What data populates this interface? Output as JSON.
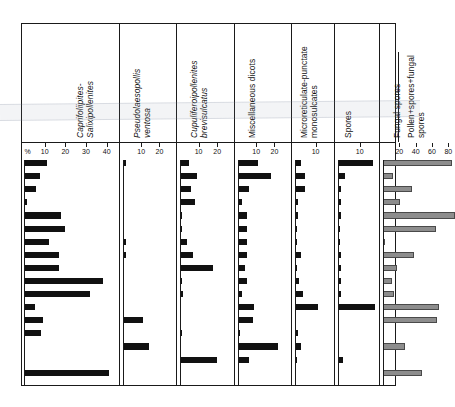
{
  "figure": {
    "type": "pollen-percentage-diagram",
    "background_color": "#ffffff",
    "bar_color": "#111111",
    "bar_color_secondary": "#8d8d8d",
    "frame_color": "#1a1a1a",
    "percent_symbol": "%",
    "n_samples": 17
  },
  "chart_data": {
    "type": "bar",
    "title": "",
    "subtitle": "",
    "xlabel": "",
    "ylabel": "",
    "orientation": "horizontal",
    "grid": false,
    "legend_position": "none",
    "categories": [
      "1",
      "2",
      "3",
      "4",
      "5",
      "6",
      "7",
      "8",
      "9",
      "10",
      "11",
      "12",
      "13",
      "14",
      "15",
      "16",
      "17"
    ],
    "panels": [
      {
        "name": "Caprifoliipites-Salixipollenites",
        "label_lines": [
          "Caprifoliipites-",
          "Salixipollenites"
        ],
        "italic": true,
        "axis_prefix": "%",
        "ticks": [
          10,
          20,
          30,
          40
        ],
        "tick_labels": [
          "10",
          "20",
          "30",
          "40"
        ],
        "xlim": [
          0,
          45
        ],
        "values": [
          11,
          7.5,
          6,
          1.5,
          18,
          20,
          12,
          17,
          17,
          38,
          32,
          5.5,
          9,
          8,
          0,
          0,
          41
        ],
        "bar_style": "dark"
      },
      {
        "name": "Pseudolaesopollis ventosa",
        "label_lines": [
          "Pseudolaesopollis",
          "ventosa"
        ],
        "italic": true,
        "axis_prefix": "",
        "ticks": [
          10,
          20
        ],
        "tick_labels": [
          "10",
          "20"
        ],
        "xlim": [
          0,
          28
        ],
        "values": [
          1.5,
          0,
          0,
          0,
          0,
          0,
          1.5,
          1.5,
          0,
          0,
          0,
          0,
          11,
          0,
          14,
          0,
          0
        ],
        "bar_style": "dark"
      },
      {
        "name": "Cupuliferoipollenites brevisulcatus",
        "label_lines": [
          "Cupuliferoipollenites",
          "brevisulcatus"
        ],
        "italic": true,
        "axis_prefix": "",
        "ticks": [
          10,
          20
        ],
        "tick_labels": [
          "10",
          "20"
        ],
        "xlim": [
          0,
          28
        ],
        "values": [
          5,
          9,
          6,
          8,
          1,
          1,
          4,
          7,
          18,
          1,
          1.5,
          0,
          0,
          1,
          0,
          20,
          0
        ],
        "bar_style": "dark"
      },
      {
        "name": "Miscellaneous dicots",
        "label_lines": [
          "Miscellaneous dicots"
        ],
        "italic": false,
        "axis_prefix": "",
        "ticks": [
          10,
          20
        ],
        "tick_labels": [
          "10",
          "20"
        ],
        "xlim": [
          0,
          28
        ],
        "values": [
          11,
          18,
          6,
          2,
          5,
          5,
          5,
          5,
          4,
          5,
          2,
          9,
          8,
          1,
          22,
          6,
          0
        ],
        "bar_style": "dark"
      },
      {
        "name": "Microreticulate-punctate monosulcates",
        "label_lines": [
          "Microreticulate-punctate",
          "monosulcates"
        ],
        "italic": false,
        "axis_prefix": "",
        "ticks": [
          10
        ],
        "tick_labels": [
          "10"
        ],
        "xlim": [
          0,
          18
        ],
        "values": [
          3,
          5,
          5,
          1.5,
          1.5,
          0.8,
          1.2,
          3,
          0.8,
          2,
          4,
          11,
          0,
          1.5,
          3,
          1,
          0
        ],
        "bar_style": "dark"
      },
      {
        "name": "Spores",
        "label_lines": [
          "Spores"
        ],
        "italic": false,
        "axis_prefix": "",
        "ticks": [
          10
        ],
        "tick_labels": [
          "10"
        ],
        "xlim": [
          0,
          18
        ],
        "values": [
          16,
          3,
          1.5,
          1.5,
          1.5,
          0.8,
          0.8,
          1.2,
          1.2,
          1.5,
          1.5,
          17,
          0,
          0,
          0,
          2.5,
          0
        ],
        "bar_style": "dark"
      },
      {
        "name": "Pollen+spores+fungal spores",
        "label_lines": [
          "Fungal spores"
        ],
        "sublabel_lines": [
          "Pollen+spores+fungal",
          "spores"
        ],
        "italic": false,
        "axis_prefix": "",
        "ticks": [
          20,
          40,
          60,
          80
        ],
        "tick_labels": [
          "20",
          "40",
          "60",
          "80"
        ],
        "xlim": [
          0,
          98
        ],
        "values": [
          84,
          12,
          36,
          21,
          88,
          65,
          3,
          38,
          17,
          11,
          13,
          68,
          66,
          0,
          27,
          0,
          48
        ],
        "bar_style": "gray"
      }
    ]
  }
}
